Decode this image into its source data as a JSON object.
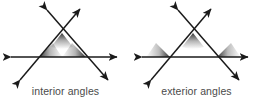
{
  "figure": {
    "background_color": "#ffffff",
    "stroke_color": "#1a1a1a",
    "shade_color": "#2b2b2b",
    "caption_color": "#4a4a4a",
    "width": 262,
    "height": 103,
    "panels": [
      {
        "id": "interior",
        "caption": "interior angles",
        "angle_type": "interior",
        "description": "Triangle formed by three intersecting lines with double-headed arrows; shaded wedges mark the three interior angles of the triangle.",
        "vertices": {
          "apex": [
            62,
            33
          ],
          "bottom_left": [
            39,
            57
          ],
          "bottom_right": [
            86,
            57
          ]
        },
        "lines": [
          {
            "name": "horizontal-transversal",
            "from": [
              11,
              57
            ],
            "to": [
              117,
              57
            ],
            "arrows": "both"
          },
          {
            "name": "left-diagonal",
            "from": [
              20,
              80
            ],
            "to": [
              80,
              9
            ],
            "arrows": "both"
          },
          {
            "name": "right-diagonal",
            "from": [
              47,
              10
            ],
            "to": [
              108,
              80
            ],
            "arrows": "both"
          }
        ],
        "shaded_angles": [
          {
            "at": "apex",
            "side": "inside"
          },
          {
            "at": "bottom_left",
            "side": "inside"
          },
          {
            "at": "bottom_right",
            "side": "inside"
          }
        ]
      },
      {
        "id": "exterior",
        "caption": "exterior angles",
        "angle_type": "exterior",
        "description": "Same triangle of three intersecting lines; shaded wedges mark the exterior angles lying outside the triangle.",
        "vertices": {
          "apex": [
            193,
            33
          ],
          "bottom_left": [
            170,
            57
          ],
          "bottom_right": [
            217,
            57
          ]
        },
        "lines": [
          {
            "name": "horizontal-transversal",
            "from": [
              142,
              57
            ],
            "to": [
              248,
              57
            ],
            "arrows": "both"
          },
          {
            "name": "left-diagonal",
            "from": [
              151,
              80
            ],
            "to": [
              211,
              9
            ],
            "arrows": "both"
          },
          {
            "name": "right-diagonal",
            "from": [
              178,
              10
            ],
            "to": [
              239,
              80
            ],
            "arrows": "both"
          }
        ],
        "shaded_angles": [
          {
            "at": "apex",
            "side": "vertical-below"
          },
          {
            "at": "bottom_left",
            "side": "outside-upper-left"
          },
          {
            "at": "bottom_right",
            "side": "outside-upper-right"
          }
        ]
      }
    ]
  }
}
